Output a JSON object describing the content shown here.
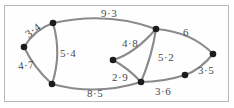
{
  "diagram": {
    "type": "weighted-graph",
    "background_color": "#ffffff",
    "frame_color": "#b9b9b9",
    "edge_color": "#8a8a8a",
    "node_color": "#1c1c1c",
    "label_color": "#4a4a4a",
    "nodes": [
      {
        "id": "A",
        "x": 24,
        "y": 47
      },
      {
        "id": "B",
        "x": 53,
        "y": 23
      },
      {
        "id": "C",
        "x": 52,
        "y": 84
      },
      {
        "id": "D",
        "x": 113,
        "y": 60
      },
      {
        "id": "E",
        "x": 156,
        "y": 29
      },
      {
        "id": "F",
        "x": 141,
        "y": 82
      },
      {
        "id": "G",
        "x": 185,
        "y": 75
      },
      {
        "id": "H",
        "x": 213,
        "y": 54
      }
    ],
    "edges": [
      {
        "from": "A",
        "to": "B",
        "weight": "3·4",
        "value": 3.4,
        "path": "M 24 47 Q 34 30 53 23"
      },
      {
        "from": "A",
        "to": "C",
        "weight": "4·7",
        "value": 4.7,
        "path": "M 24 47 Q 34 68 52 84"
      },
      {
        "from": "B",
        "to": "C",
        "weight": "5·4",
        "value": 5.4,
        "path": "M 53 23 Q 62 54 52 84"
      },
      {
        "from": "B",
        "to": "E",
        "weight": "9·3",
        "value": 9.3,
        "path": "M 53 23 Q 108 11 156 29"
      },
      {
        "from": "C",
        "to": "F",
        "weight": "8·5",
        "value": 8.5,
        "path": "M 52 84 Q 96 96 141 82"
      },
      {
        "from": "D",
        "to": "E",
        "weight": "4·8",
        "value": 4.8,
        "path": "M 113 60 Q 134 54 156 29"
      },
      {
        "from": "D",
        "to": "F",
        "weight": "2·9",
        "value": 2.9,
        "path": "M 113 60 Q 128 68 141 82"
      },
      {
        "from": "E",
        "to": "F",
        "weight": "5·2",
        "value": 5.2,
        "path": "M 156 29 Q 152 56 141 82"
      },
      {
        "from": "E",
        "to": "H",
        "weight": "6",
        "value": 6,
        "path": "M 156 29 Q 192 32 213 54"
      },
      {
        "from": "F",
        "to": "G",
        "weight": "3·6",
        "value": 3.6,
        "path": "M 141 82 Q 163 82 185 75"
      },
      {
        "from": "G",
        "to": "H",
        "weight": "3·5",
        "value": 3.5,
        "path": "M 185 75 Q 200 70 213 54"
      }
    ],
    "labels": [
      {
        "name": "edge-weight-3-4",
        "text": "3·4",
        "x": 25,
        "y": 25,
        "rotate": -38
      },
      {
        "name": "edge-weight-9-3",
        "text": "9·3",
        "x": 101,
        "y": 8,
        "rotate": 0
      },
      {
        "name": "edge-weight-4-7",
        "text": "4·7",
        "x": 18,
        "y": 60,
        "rotate": -6
      },
      {
        "name": "edge-weight-5-4",
        "text": "5·4",
        "x": 60,
        "y": 48,
        "rotate": 0
      },
      {
        "name": "edge-weight-4-8",
        "text": "4·8",
        "x": 122,
        "y": 38,
        "rotate": 0
      },
      {
        "name": "edge-weight-6",
        "text": "6",
        "x": 183,
        "y": 27,
        "rotate": 0
      },
      {
        "name": "edge-weight-5-2",
        "text": "5·2",
        "x": 158,
        "y": 52,
        "rotate": 0
      },
      {
        "name": "edge-weight-3-5",
        "text": "3·5",
        "x": 198,
        "y": 65,
        "rotate": 0
      },
      {
        "name": "edge-weight-2-9",
        "text": "2·9",
        "x": 112,
        "y": 72,
        "rotate": 0
      },
      {
        "name": "edge-weight-3-6",
        "text": "3·6",
        "x": 155,
        "y": 86,
        "rotate": 0
      },
      {
        "name": "edge-weight-8-5",
        "text": "8·5",
        "x": 87,
        "y": 88,
        "rotate": 0
      }
    ]
  }
}
